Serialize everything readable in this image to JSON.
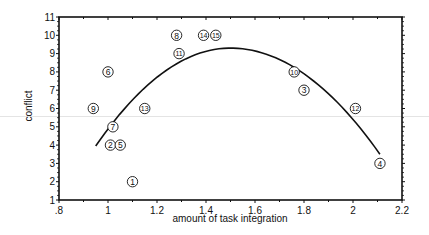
{
  "chart_data": {
    "type": "scatter",
    "title": "",
    "xlabel": "amount of task integration",
    "ylabel": "conflict",
    "xlim": [
      0.8,
      2.2
    ],
    "ylim": [
      1,
      11
    ],
    "x_ticks": [
      0.8,
      1.0,
      1.2,
      1.4,
      1.6,
      1.8,
      2.0,
      2.2
    ],
    "x_tick_labels": [
      ".8",
      "1",
      "1.2",
      "1.4",
      "1.6",
      "1.8",
      "2",
      "2.2"
    ],
    "y_ticks": [
      1,
      2,
      3,
      4,
      5,
      6,
      7,
      8,
      9,
      10,
      11
    ],
    "y_tick_labels": [
      "1",
      "2",
      "3",
      "4",
      "5",
      "6",
      "7",
      "8",
      "9",
      "10",
      "11"
    ],
    "grid": false,
    "legend": null,
    "points": [
      {
        "label": "1",
        "x": 1.1,
        "y": 2
      },
      {
        "label": "2",
        "x": 1.01,
        "y": 4
      },
      {
        "label": "3",
        "x": 1.8,
        "y": 7
      },
      {
        "label": "4",
        "x": 2.11,
        "y": 3
      },
      {
        "label": "5",
        "x": 1.05,
        "y": 4
      },
      {
        "label": "6",
        "x": 1.0,
        "y": 8
      },
      {
        "label": "7",
        "x": 1.02,
        "y": 5
      },
      {
        "label": "8",
        "x": 1.28,
        "y": 10
      },
      {
        "label": "9",
        "x": 0.94,
        "y": 6
      },
      {
        "label": "10",
        "x": 1.76,
        "y": 8
      },
      {
        "label": "11",
        "x": 1.29,
        "y": 9
      },
      {
        "label": "12",
        "x": 2.01,
        "y": 6
      },
      {
        "label": "13",
        "x": 1.15,
        "y": 6
      },
      {
        "label": "14",
        "x": 1.39,
        "y": 10
      },
      {
        "label": "15",
        "x": 1.44,
        "y": 10
      }
    ],
    "fit_curve": {
      "type": "quadratic",
      "x_range": [
        0.95,
        2.11
      ],
      "samples": [
        {
          "x": 0.95,
          "y": 3.95
        },
        {
          "x": 1.1,
          "y": 6.3
        },
        {
          "x": 1.3,
          "y": 8.6
        },
        {
          "x": 1.5,
          "y": 9.3
        },
        {
          "x": 1.7,
          "y": 8.6
        },
        {
          "x": 1.9,
          "y": 6.5
        },
        {
          "x": 2.11,
          "y": 3.5
        }
      ]
    }
  }
}
